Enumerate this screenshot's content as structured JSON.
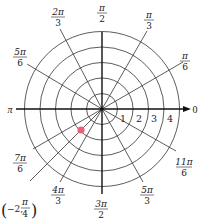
{
  "diagram": {
    "type": "polar-grid",
    "center": {
      "x": 102,
      "y": 109
    },
    "ring_spacing_px": 15.5,
    "ring_count": 5,
    "ring_color": "#333333",
    "axis_color": "#222222",
    "radial_labels": [
      "1",
      "2",
      "3",
      "4"
    ],
    "angle_labels": [
      {
        "id": "0",
        "text": "0"
      },
      {
        "id": "pi6",
        "num": "π",
        "den": "6"
      },
      {
        "id": "pi3",
        "num": "π",
        "den": "3"
      },
      {
        "id": "pi2",
        "num": "π",
        "den": "2"
      },
      {
        "id": "2pi3",
        "num": "2π",
        "den": "3"
      },
      {
        "id": "5pi6",
        "num": "5π",
        "den": "6"
      },
      {
        "id": "pi",
        "text": "π"
      },
      {
        "id": "7pi6",
        "num": "7π",
        "den": "6"
      },
      {
        "id": "4pi3",
        "num": "4π",
        "den": "3"
      },
      {
        "id": "3pi2",
        "num": "3π",
        "den": "2"
      },
      {
        "id": "5pi3",
        "num": "5π",
        "den": "3"
      },
      {
        "id": "11pi6",
        "num": "11π",
        "den": "6"
      }
    ],
    "point": {
      "label": "(−2, π/4)",
      "label_prefix": "−2,",
      "label_num": "π",
      "label_den": "4",
      "r": -2,
      "theta": "π/4",
      "color": "#e8607a"
    }
  }
}
